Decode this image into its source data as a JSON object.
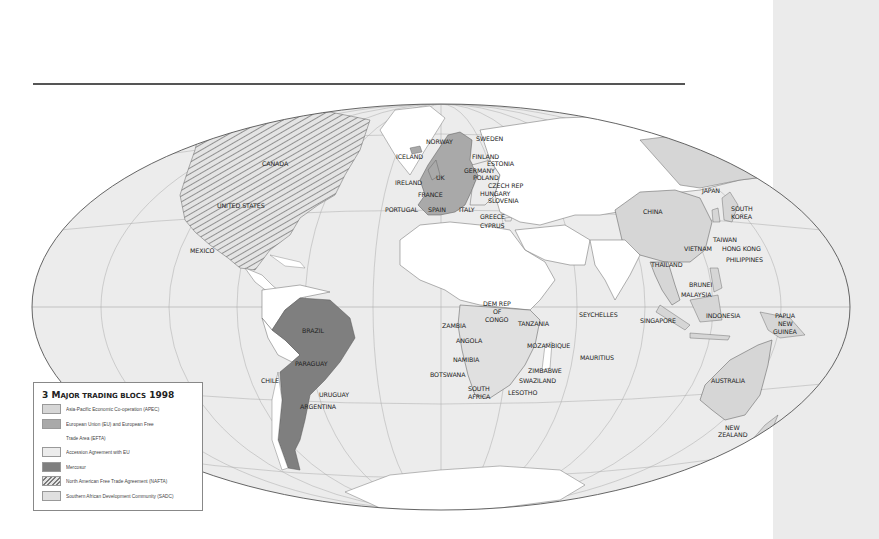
{
  "map": {
    "projection": "Mollweide world",
    "colors": {
      "ocean": "#ececec",
      "land": "#ffffff",
      "apec": "#d6d6d6",
      "eu_efta": "#a9a9a9",
      "accession": "#ececec",
      "mercosur": "#7f7f7f",
      "nafta_hatch": "#8a8a8a",
      "sadc": "#e0e0e0",
      "outline": "#555555",
      "side_panel": "#ebebeb"
    },
    "labels": {
      "canada": "CANADA",
      "united_states": "UNITED STATES",
      "mexico": "MEXICO",
      "iceland": "ICELAND",
      "norway": "NORWAY",
      "sweden": "SWEDEN",
      "finland": "FINLAND",
      "estonia": "ESTONIA",
      "germany": "GERMANY",
      "poland": "POLAND",
      "uk": "UK",
      "ireland": "IRELAND",
      "france": "FRANCE",
      "czech_rep": "CZECH REP",
      "hungary": "HUNGARY",
      "slovenia": "SLOVENIA",
      "portugal": "PORTUGAL",
      "spain": "SPAIN",
      "italy": "ITALY",
      "greece": "GREECE",
      "cyprus": "CYPRUS",
      "china": "CHINA",
      "japan": "JAPAN",
      "south": "SOUTH",
      "korea": "KOREA",
      "taiwan": "TAIWAN",
      "hong_kong": "HONG KONG",
      "philippines": "PHILIPPINES",
      "vietnam": "VIETNAM",
      "thailand": "THAILAND",
      "brunei": "BRUNEI",
      "malaysia": "MALAYSIA",
      "singapore": "SINGAPORE",
      "indonesia": "INDONESIA",
      "papua": "PAPUA",
      "new_png": "NEW",
      "guinea": "GUINEA",
      "australia": "AUSTRALIA",
      "new_nz": "NEW",
      "zealand": "ZEALAND",
      "seychelles": "SEYCHELLES",
      "mauritius": "MAURITIUS",
      "dem_rep": "DEM REP",
      "of": "OF",
      "congo": "CONGO",
      "tanzania": "TANZANIA",
      "zambia": "ZAMBIA",
      "angola": "ANGOLA",
      "mozambique": "MOZAMBIQUE",
      "namibia": "NAMIBIA",
      "zimbabwe": "ZIMBABWE",
      "botswana": "BOTSWANA",
      "swaziland": "SWAZILAND",
      "south_sa": "SOUTH",
      "africa": "AFRICA",
      "lesotho": "LESOTHO",
      "brazil": "BRAZIL",
      "paraguay": "PARAGUAY",
      "chile": "CHILE",
      "uruguay": "URUGUAY",
      "argentina": "ARGENTINA"
    }
  },
  "legend": {
    "title_number": "3",
    "title_cap": "M",
    "title_smallcaps": "AJOR TRADING BLOCS",
    "title_year": "1998",
    "items": [
      {
        "label": "Asia-Pacific Economic Co-operation (APEC)",
        "color": "#d6d6d6",
        "pattern": "solid"
      },
      {
        "label": "European Union (EU) and European Free",
        "label_line2": "Trade Area (EFTA)",
        "color": "#a9a9a9",
        "pattern": "solid"
      },
      {
        "label": "Accession Agreement with EU",
        "color": "#ececec",
        "pattern": "solid"
      },
      {
        "label": "Mercosur",
        "color": "#7f7f7f",
        "pattern": "solid"
      },
      {
        "label": "North American Free Trade Agreement (NAFTA)",
        "color": "#8a8a8a",
        "pattern": "hatch"
      },
      {
        "label": "Southern African Development Community (SADC)",
        "color": "#e0e0e0",
        "pattern": "solid"
      }
    ]
  }
}
